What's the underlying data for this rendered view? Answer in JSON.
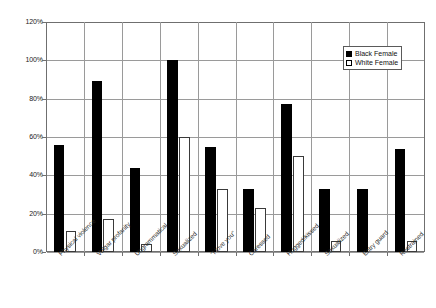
{
  "chart_data": {
    "type": "bar",
    "title": "",
    "xlabel": "",
    "ylabel": "",
    "ylim": [
      0,
      120
    ],
    "y_ticks": [
      0,
      20,
      40,
      60,
      80,
      100,
      120
    ],
    "y_tick_labels": [
      "0%",
      "20%",
      "40%",
      "60%",
      "80%",
      "100%",
      "120%"
    ],
    "grid": true,
    "legend_position": "top-right",
    "categories": [
      "Physical violence",
      "Vulgar profanity",
      "Ungrammatical",
      "Sexualized",
      "\"I love you\"",
      "Caressed",
      "Hugged/kissed",
      "Sexualized",
      "Entry guard",
      "Restrained"
    ],
    "series": [
      {
        "name": "Black Female",
        "color": "#000000",
        "values": [
          56,
          89,
          44,
          100,
          55,
          33,
          77,
          33,
          33,
          54
        ]
      },
      {
        "name": "White Female",
        "color": "#ffffff",
        "values": [
          11,
          17,
          4,
          60,
          33,
          23,
          50,
          6,
          0,
          6
        ]
      }
    ]
  },
  "legend": {
    "items": [
      {
        "label": "Black Female",
        "swatch": "black"
      },
      {
        "label": "White Female",
        "swatch": "white"
      }
    ]
  }
}
